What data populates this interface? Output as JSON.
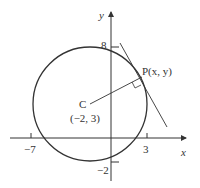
{
  "diagram": {
    "axes": {
      "x_label": "x",
      "y_label": "y"
    },
    "ticks": {
      "y_top": "8",
      "y_bottom": "−2",
      "x_left": "−7",
      "x_right": "3"
    },
    "center": {
      "name": "C",
      "coords": "(−2, 3)"
    },
    "point": {
      "label": "P(x, y)"
    },
    "colors": {
      "stroke": "#333333",
      "background": "#ffffff"
    }
  }
}
